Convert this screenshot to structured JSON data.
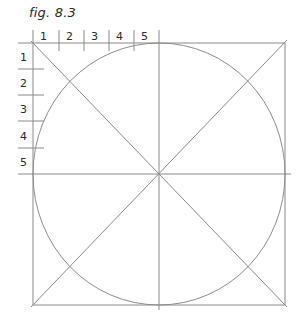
{
  "figure": {
    "caption": "fig. 8.3",
    "top_ruler_labels": [
      "1",
      "2",
      "3",
      "4",
      "5"
    ],
    "left_ruler_labels": [
      "1",
      "2",
      "3",
      "4",
      "5"
    ]
  },
  "colors": {
    "line": "#8a8a8a",
    "circle": "#8c8c8c",
    "text": "#2a2a2a",
    "background": "#ffffff"
  }
}
